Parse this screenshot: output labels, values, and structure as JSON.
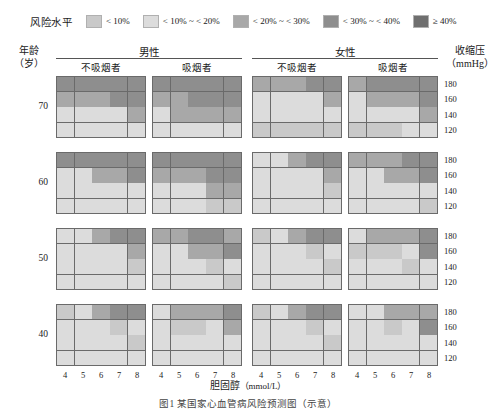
{
  "legend": {
    "title": "风险水平",
    "items": [
      {
        "label": "< 10%",
        "color": "#c9c9c9"
      },
      {
        "label": "< 10% ~ < 20%",
        "color": "#dcdcdc"
      },
      {
        "label": "< 20% ~ < 30%",
        "color": "#a8a8a8"
      },
      {
        "label": "< 30% ~ < 40%",
        "color": "#8e8e8e"
      },
      {
        "label": "≥ 40%",
        "color": "#6f6f6f"
      }
    ]
  },
  "header": {
    "age_title": "年龄",
    "age_unit": "（岁）",
    "sbp_title": "收缩压",
    "sbp_unit": "（mmHg）",
    "sex_male": "男性",
    "sex_female": "女性",
    "smoke_no": "不吸烟者",
    "smoke_yes": "吸烟者"
  },
  "axes": {
    "x_title": "胆固醇",
    "x_unit": "（mmol/L）",
    "x_ticks": [
      "4",
      "5",
      "6",
      "7",
      "8"
    ],
    "y_ticks": [
      "180",
      "160",
      "140",
      "120"
    ],
    "age_groups": [
      "70",
      "60",
      "50",
      "40"
    ]
  },
  "caption": "图1  某国家心血管病风险预测图（示意）",
  "chart_data": {
    "type": "heatmap",
    "xlabel": "胆固醇 (mmol/L)",
    "ylabel": "收缩压 (mmHg)",
    "x": [
      4,
      5,
      6,
      7,
      8
    ],
    "y": [
      180,
      160,
      140,
      120
    ],
    "risk_levels": [
      "< 10%",
      "< 10% ~ < 20%",
      "< 20% ~ < 30%",
      "< 30% ~ < 40%",
      "≥ 40%"
    ],
    "risk_colors": [
      "#c9c9c9",
      "#dcdcdc",
      "#a8a8a8",
      "#8e8e8e",
      "#6f6f6f"
    ],
    "legend_position": "top",
    "grid": true,
    "panel_rows": [
      "70",
      "60",
      "50",
      "40"
    ],
    "panel_cols": [
      {
        "sex": "男性",
        "smoking": "不吸烟者"
      },
      {
        "sex": "男性",
        "smoking": "吸烟者"
      },
      {
        "sex": "女性",
        "smoking": "不吸烟者"
      },
      {
        "sex": "女性",
        "smoking": "吸烟者"
      }
    ],
    "panels": [
      {
        "age": "70",
        "sex": "男性",
        "smoking": "不吸烟者",
        "cells": [
          [
            3,
            3,
            3,
            3,
            3
          ],
          [
            2,
            2,
            2,
            3,
            3
          ],
          [
            1,
            1,
            1,
            1,
            2
          ],
          [
            1,
            1,
            1,
            1,
            1
          ]
        ]
      },
      {
        "age": "70",
        "sex": "男性",
        "smoking": "吸烟者",
        "cells": [
          [
            3,
            3,
            3,
            3,
            3
          ],
          [
            2,
            2,
            3,
            3,
            3
          ],
          [
            1,
            2,
            2,
            2,
            2
          ],
          [
            1,
            1,
            1,
            1,
            1
          ]
        ]
      },
      {
        "age": "70",
        "sex": "女性",
        "smoking": "不吸烟者",
        "cells": [
          [
            2,
            2,
            2,
            3,
            3
          ],
          [
            1,
            1,
            1,
            1,
            2
          ],
          [
            1,
            1,
            1,
            1,
            1
          ],
          [
            0,
            0,
            0,
            0,
            0
          ]
        ]
      },
      {
        "age": "70",
        "sex": "女性",
        "smoking": "吸烟者",
        "cells": [
          [
            2,
            3,
            3,
            3,
            3
          ],
          [
            1,
            2,
            2,
            2,
            3
          ],
          [
            1,
            1,
            1,
            1,
            2
          ],
          [
            0,
            0,
            0,
            1,
            1
          ]
        ]
      },
      {
        "age": "60",
        "sex": "男性",
        "smoking": "不吸烟者",
        "cells": [
          [
            3,
            3,
            3,
            3,
            3
          ],
          [
            1,
            1,
            2,
            2,
            3
          ],
          [
            1,
            1,
            1,
            1,
            1
          ],
          [
            1,
            1,
            1,
            1,
            1
          ]
        ]
      },
      {
        "age": "60",
        "sex": "男性",
        "smoking": "吸烟者",
        "cells": [
          [
            3,
            3,
            3,
            3,
            3
          ],
          [
            2,
            2,
            2,
            3,
            3
          ],
          [
            1,
            1,
            1,
            2,
            2
          ],
          [
            1,
            1,
            1,
            0,
            0
          ]
        ]
      },
      {
        "age": "60",
        "sex": "女性",
        "smoking": "不吸烟者",
        "cells": [
          [
            1,
            1,
            2,
            3,
            3
          ],
          [
            1,
            1,
            1,
            1,
            2
          ],
          [
            1,
            1,
            1,
            1,
            0
          ],
          [
            1,
            1,
            1,
            1,
            1
          ]
        ]
      },
      {
        "age": "60",
        "sex": "女性",
        "smoking": "吸烟者",
        "cells": [
          [
            2,
            2,
            2,
            3,
            3
          ],
          [
            1,
            1,
            2,
            2,
            3
          ],
          [
            1,
            1,
            1,
            1,
            1
          ],
          [
            1,
            1,
            1,
            1,
            0
          ]
        ]
      },
      {
        "age": "50",
        "sex": "男性",
        "smoking": "不吸烟者",
        "cells": [
          [
            1,
            1,
            2,
            3,
            3
          ],
          [
            1,
            1,
            1,
            1,
            2
          ],
          [
            1,
            1,
            1,
            1,
            0
          ],
          [
            1,
            1,
            1,
            1,
            1
          ]
        ]
      },
      {
        "age": "50",
        "sex": "男性",
        "smoking": "吸烟者",
        "cells": [
          [
            2,
            2,
            3,
            3,
            2
          ],
          [
            1,
            1,
            2,
            2,
            3
          ],
          [
            1,
            1,
            1,
            0,
            1
          ],
          [
            1,
            1,
            1,
            1,
            0
          ]
        ]
      },
      {
        "age": "50",
        "sex": "女性",
        "smoking": "不吸烟者",
        "cells": [
          [
            0,
            1,
            2,
            3,
            3
          ],
          [
            1,
            1,
            1,
            0,
            1
          ],
          [
            1,
            1,
            1,
            1,
            0
          ],
          [
            1,
            1,
            1,
            1,
            1
          ]
        ]
      },
      {
        "age": "50",
        "sex": "女性",
        "smoking": "吸烟者",
        "cells": [
          [
            1,
            2,
            2,
            2,
            3
          ],
          [
            0,
            0,
            0,
            1,
            3
          ],
          [
            1,
            1,
            1,
            0,
            1
          ],
          [
            1,
            1,
            1,
            1,
            1
          ]
        ]
      },
      {
        "age": "40",
        "sex": "男性",
        "smoking": "不吸烟者",
        "cells": [
          [
            0,
            1,
            2,
            3,
            3
          ],
          [
            1,
            1,
            1,
            0,
            1
          ],
          [
            1,
            1,
            1,
            1,
            0
          ],
          [
            1,
            1,
            1,
            1,
            1
          ]
        ]
      },
      {
        "age": "40",
        "sex": "男性",
        "smoking": "吸烟者",
        "cells": [
          [
            1,
            2,
            2,
            2,
            3
          ],
          [
            1,
            0,
            0,
            1,
            2
          ],
          [
            1,
            1,
            1,
            1,
            1
          ],
          [
            1,
            1,
            1,
            1,
            1
          ]
        ]
      },
      {
        "age": "40",
        "sex": "女性",
        "smoking": "不吸烟者",
        "cells": [
          [
            0,
            1,
            2,
            3,
            3
          ],
          [
            1,
            1,
            1,
            0,
            1
          ],
          [
            1,
            1,
            1,
            1,
            0
          ],
          [
            1,
            1,
            1,
            1,
            1
          ]
        ]
      },
      {
        "age": "40",
        "sex": "女性",
        "smoking": "吸烟者",
        "cells": [
          [
            1,
            1,
            2,
            2,
            2
          ],
          [
            1,
            1,
            0,
            1,
            3
          ],
          [
            1,
            1,
            1,
            1,
            1
          ],
          [
            1,
            1,
            1,
            1,
            1
          ]
        ]
      }
    ]
  }
}
